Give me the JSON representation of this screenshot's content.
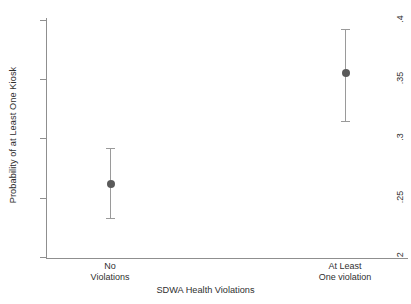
{
  "chart_data": {
    "type": "scatter",
    "title": "",
    "subtitle": "",
    "xlabel": "SDWA Health Violations",
    "ylabel": "Probability of at Least One Kiosk",
    "categories": [
      "No\nViolations",
      "At Least\nOne violation"
    ],
    "category_labels": [
      {
        "line1": "No",
        "line2": "Violations"
      },
      {
        "line1": "At Least",
        "line2": "One violation"
      }
    ],
    "ylim": [
      0.2,
      0.4
    ],
    "yticks": [
      0.2,
      0.25,
      0.3,
      0.35,
      0.4
    ],
    "ytick_labels": [
      ".2",
      ".25",
      ".3",
      ".35",
      ".4"
    ],
    "xtick_labels": [
      "No Violations",
      "At Least One violation"
    ],
    "grid": false,
    "legend": false,
    "legend_position": "none",
    "error_bars": true,
    "series": [
      {
        "name": "Predicted probability",
        "x": [
          "No Violations",
          "At Least One violation"
        ],
        "values": [
          0.262,
          0.355
        ],
        "ci_low": [
          0.233,
          0.315
        ],
        "ci_high": [
          0.292,
          0.392
        ],
        "marker_color": "#5a5a5a",
        "errorbar_color": "#9a9a9a"
      }
    ],
    "annotations": []
  },
  "colors": {
    "background": "#ffffff",
    "axis": "#8f8f8f",
    "text": "#2f2f2f",
    "marker": "#5a5a5a",
    "errorbar": "#9a9a9a"
  }
}
